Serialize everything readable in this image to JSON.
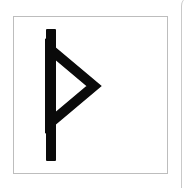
{
  "canvas": {
    "width": 193,
    "height": 188,
    "background_color": "#ffffff"
  },
  "page_edge": {
    "name": "sheet-edge",
    "color": "#c9c9c9",
    "visible": true
  },
  "card": {
    "name": "glyph-card",
    "border_color": "#bdbdbd",
    "fill_color": "#ffffff",
    "x": 13,
    "y": 16,
    "width": 155,
    "height": 158
  },
  "glyph": {
    "name": "thurisaz-rune",
    "character": "ᚦ",
    "label": "Thurisaz",
    "script": "Elder Futhark",
    "color": "#0a0a0a",
    "description": "Vertical stem with hollow right-pointing triangle",
    "stroke_width": 9,
    "stem": {
      "x": 73,
      "top": 36,
      "bottom": 152,
      "width": 9
    },
    "triangle": {
      "top_y": 57,
      "bottom_y": 128,
      "apex_x": 115,
      "base_x": 82
    }
  }
}
